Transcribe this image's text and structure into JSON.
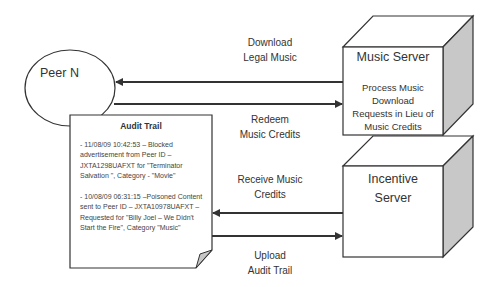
{
  "diagram": {
    "peer": {
      "label": "Peer N"
    },
    "music_server": {
      "title": "Music Server",
      "description": "Process Music Download Requests in Lieu of Music Credits",
      "description_lines": [
        "Process Music",
        "Download",
        "Requests in Lieu of",
        "Music Credits"
      ]
    },
    "incentive_server": {
      "title_lines": [
        "Incentive",
        "Server"
      ]
    },
    "audit_trail": {
      "title": "Audit Trail",
      "entries": [
        {
          "text": "- 11/08/09 10:42:53 – Blocked advertisement from Peer ID – JXTA1298UAFXT for \"Terminator Salvation \", Category - \"Movie\"",
          "lines": [
            "- 11/08/09 10:42:53 – Blocked",
            "advertisement from Peer ID –",
            "JXTA1298UAFXT for \"Terminator",
            "Salvation \", Category - \"Movie\""
          ]
        },
        {
          "text": "- 10/08/09 06:31:15 –Poisoned Content sent to Peer ID – JXTA10978UAFXT – Requested for \"Billy Joel – We Didn't Start the Fire\", Category \"Music\"",
          "lines": [
            "- 10/08/09 06:31:15 –Poisoned Content",
            "sent to Peer ID – JXTA10978UAFXT –",
            "Requested for \"Billy Joel – We Didn't",
            "Start the Fire\", Category \"Music\""
          ]
        }
      ]
    },
    "arrows": [
      {
        "id": "download",
        "direction": "to-peer",
        "from": "Music Server",
        "to": "Peer N",
        "label_lines": [
          "Download",
          "Legal Music"
        ]
      },
      {
        "id": "redeem",
        "direction": "to-server",
        "from": "Peer N",
        "to": "Music Server",
        "label_lines": [
          "Redeem",
          "Music Credits"
        ]
      },
      {
        "id": "receive",
        "direction": "to-peer",
        "from": "Incentive Server",
        "to": "Audit Trail",
        "label_lines": [
          "Receive Music",
          "Credits"
        ]
      },
      {
        "id": "upload",
        "direction": "to-server",
        "from": "Audit Trail",
        "to": "Incentive Server",
        "label_lines": [
          "Upload",
          "Audit Trail"
        ]
      }
    ],
    "colors": {
      "stroke": "#333333",
      "cube_side": "#c8c8c8",
      "text": "#333333",
      "background": "#ffffff"
    }
  }
}
